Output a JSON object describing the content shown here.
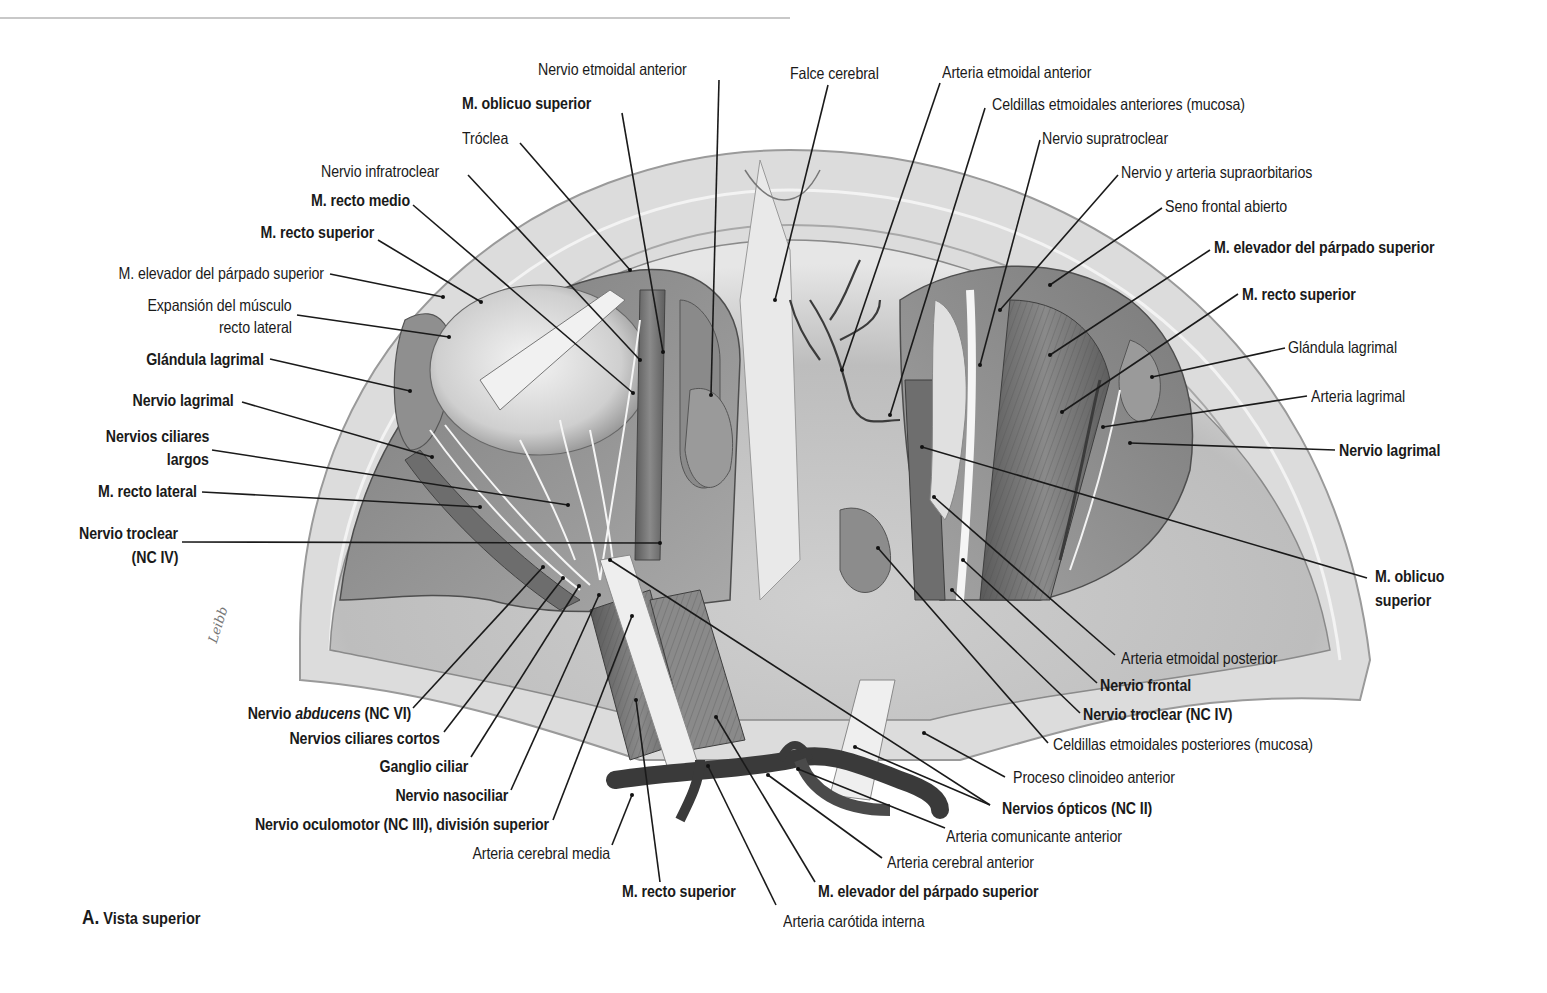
{
  "figure": {
    "caption_letter": "A.",
    "caption_text": "Vista superior",
    "artist_signature": "Leibb",
    "colors": {
      "background": "#ffffff",
      "bone": "#d9d9d9",
      "bone_edge": "#8a8a8a",
      "orbit_cavity": "#9a9a9a",
      "muscle": "#6f6f6f",
      "vessel": "#3a3a3a",
      "nerve": "#f2f2f2",
      "label_text": "#1a1a1a",
      "leader_line": "#1a1a1a"
    }
  },
  "labels": {
    "top": [
      {
        "id": "nervio-etmoidal-anterior",
        "text": "Nervio etmoidal anterior",
        "bold": false
      },
      {
        "id": "falce-cerebral",
        "text": "Falce cerebral",
        "bold": false
      },
      {
        "id": "arteria-etmoidal-anterior",
        "text": "Arteria etmoidal anterior",
        "bold": false
      },
      {
        "id": "m-oblicuo-superior-top",
        "text": "M. oblicuo superior",
        "bold": true
      },
      {
        "id": "celdillas-etmoidales-anteriores",
        "text": "Celdillas etmoidales anteriores (mucosa)",
        "bold": false
      },
      {
        "id": "troclea",
        "text": "Tróclea",
        "bold": false
      },
      {
        "id": "nervio-supratroclear",
        "text": "Nervio supratroclear",
        "bold": false
      },
      {
        "id": "nervio-infratroclear",
        "text": "Nervio infratroclear",
        "bold": false
      },
      {
        "id": "nervio-arteria-supraorbitarios",
        "text": "Nervio y arteria supraorbitarios",
        "bold": false
      },
      {
        "id": "seno-frontal-abierto",
        "text": "Seno frontal abierto",
        "bold": false
      }
    ],
    "left": [
      {
        "id": "m-recto-medio",
        "text": "M. recto medio",
        "bold": true
      },
      {
        "id": "m-recto-superior-left",
        "text": "M. recto superior",
        "bold": true
      },
      {
        "id": "m-elevador-left",
        "text": "M. elevador del párpado superior",
        "bold": false
      },
      {
        "id": "expansion-recto-lateral-1",
        "text": "Expansión del músculo",
        "bold": false
      },
      {
        "id": "expansion-recto-lateral-2",
        "text": "recto lateral",
        "bold": false
      },
      {
        "id": "glandula-lagrimal-left",
        "text": "Glándula lagrimal",
        "bold": true
      },
      {
        "id": "nervio-lagrimal-left",
        "text": "Nervio lagrimal",
        "bold": true
      },
      {
        "id": "nervios-ciliares-largos-1",
        "text": "Nervios ciliares",
        "bold": true
      },
      {
        "id": "nervios-ciliares-largos-2",
        "text": "largos",
        "bold": true
      },
      {
        "id": "m-recto-lateral",
        "text": "M. recto lateral",
        "bold": true
      },
      {
        "id": "nervio-troclear-left-1",
        "text": "Nervio troclear",
        "bold": true
      },
      {
        "id": "nervio-troclear-left-2",
        "text": "(NC IV)",
        "bold": true
      }
    ],
    "right": [
      {
        "id": "m-elevador-right",
        "text": "M. elevador del párpado superior",
        "bold": true
      },
      {
        "id": "m-recto-superior-right",
        "text": "M. recto superior",
        "bold": true
      },
      {
        "id": "glandula-lagrimal-right",
        "text": "Glándula lagrimal",
        "bold": false
      },
      {
        "id": "arteria-lagrimal",
        "text": "Arteria lagrimal",
        "bold": false
      },
      {
        "id": "nervio-lagrimal-right",
        "text": "Nervio lagrimal",
        "bold": true
      },
      {
        "id": "m-oblicuo-superior-right-1",
        "text": "M. oblicuo",
        "bold": true
      },
      {
        "id": "m-oblicuo-superior-right-2",
        "text": "superior",
        "bold": true
      },
      {
        "id": "arteria-etmoidal-posterior",
        "text": "Arteria etmoidal posterior",
        "bold": false
      },
      {
        "id": "nervio-frontal",
        "text": "Nervio frontal",
        "bold": true
      },
      {
        "id": "nervio-troclear-right",
        "text": "Nervio troclear (NC IV)",
        "bold": true
      },
      {
        "id": "celdillas-etmoidales-posteriores",
        "text": "Celdillas etmoidales posteriores (mucosa)",
        "bold": false
      },
      {
        "id": "proceso-clinoideo-anterior",
        "text": "Proceso clinoideo anterior",
        "bold": false
      },
      {
        "id": "nervios-opticos",
        "text": "Nervios ópticos (NC II)",
        "bold": true
      },
      {
        "id": "arteria-comunicante-anterior",
        "text": "Arteria comunicante anterior",
        "bold": false
      },
      {
        "id": "arteria-cerebral-anterior",
        "text": "Arteria cerebral anterior",
        "bold": false
      }
    ],
    "bottom": [
      {
        "id": "nervio-abducens-pre",
        "text": "Nervio ",
        "bold": true
      },
      {
        "id": "nervio-abducens-italic",
        "text": "abducens",
        "bold": true
      },
      {
        "id": "nervio-abducens-post",
        "text": " (NC VI)",
        "bold": true
      },
      {
        "id": "nervios-ciliares-cortos",
        "text": "Nervios ciliares cortos",
        "bold": true
      },
      {
        "id": "ganglio-ciliar",
        "text": "Ganglio ciliar",
        "bold": true
      },
      {
        "id": "nervio-nasociliar",
        "text": "Nervio nasociliar",
        "bold": true
      },
      {
        "id": "nervio-oculomotor",
        "text": "Nervio oculomotor (NC III), división superior",
        "bold": true
      },
      {
        "id": "arteria-cerebral-media",
        "text": "Arteria cerebral media",
        "bold": false
      },
      {
        "id": "m-recto-superior-bottom",
        "text": "M. recto superior",
        "bold": true
      },
      {
        "id": "m-elevador-bottom",
        "text": "M. elevador del párpado superior",
        "bold": true
      },
      {
        "id": "arteria-carotida-interna",
        "text": "Arteria carótida interna",
        "bold": false
      }
    ]
  }
}
